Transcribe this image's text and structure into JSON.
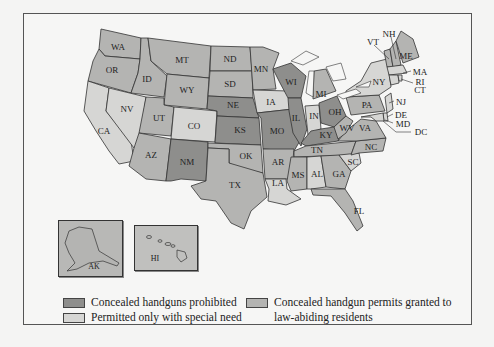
{
  "legend": {
    "prohibited": {
      "label": "Concealed handguns prohibited",
      "color": "#8e8e8c"
    },
    "special_need": {
      "label": "Permitted only with special need",
      "color": "#d6d6d4"
    },
    "granted": {
      "label": "Concealed handgun permits granted to",
      "label2": "law-abiding residents",
      "color": "#b4b4b2"
    }
  },
  "states": {
    "WA": "WA",
    "OR": "OR",
    "CA": "CA",
    "NV": "NV",
    "ID": "ID",
    "MT": "MT",
    "WY": "WY",
    "UT": "UT",
    "CO": "CO",
    "AZ": "AZ",
    "NM": "NM",
    "ND": "ND",
    "SD": "SD",
    "NE": "NE",
    "KS": "KS",
    "OK": "OK",
    "TX": "TX",
    "MN": "MN",
    "IA": "IA",
    "MO": "MO",
    "AR": "AR",
    "LA": "LA",
    "WI": "WI",
    "IL": "IL",
    "MI": "MI",
    "IN": "IN",
    "OH": "OH",
    "KY": "KY",
    "TN": "TN",
    "MS": "MS",
    "AL": "AL",
    "GA": "GA",
    "FL": "FL",
    "SC": "SC",
    "NC": "NC",
    "VA": "VA",
    "WV": "WV",
    "PA": "PA",
    "NY": "NY",
    "VT": "VT",
    "NH": "NH",
    "ME": "ME",
    "MA": "MA",
    "RI": "RI",
    "CT": "CT",
    "NJ": "NJ",
    "DE": "DE",
    "MD": "MD",
    "DC": "DC",
    "AK": "AK",
    "HI": "HI"
  },
  "categories": {
    "prohibited": [
      "NE",
      "KS",
      "NM",
      "WI",
      "IL",
      "MO",
      "OH",
      "KY"
    ],
    "special_need": [
      "CA",
      "NV",
      "CO",
      "IA",
      "IN",
      "NY",
      "NJ",
      "DE",
      "MD",
      "AL",
      "HI",
      "RI",
      "MA",
      "CT",
      "DC"
    ],
    "granted": [
      "WA",
      "OR",
      "ID",
      "MT",
      "WY",
      "UT",
      "AZ",
      "ND",
      "SD",
      "OK",
      "TX",
      "MN",
      "AR",
      "LA",
      "MI",
      "TN",
      "MS",
      "GA",
      "FL",
      "SC",
      "NC",
      "VA",
      "WV",
      "PA",
      "VT",
      "NH",
      "ME",
      "AK"
    ]
  }
}
